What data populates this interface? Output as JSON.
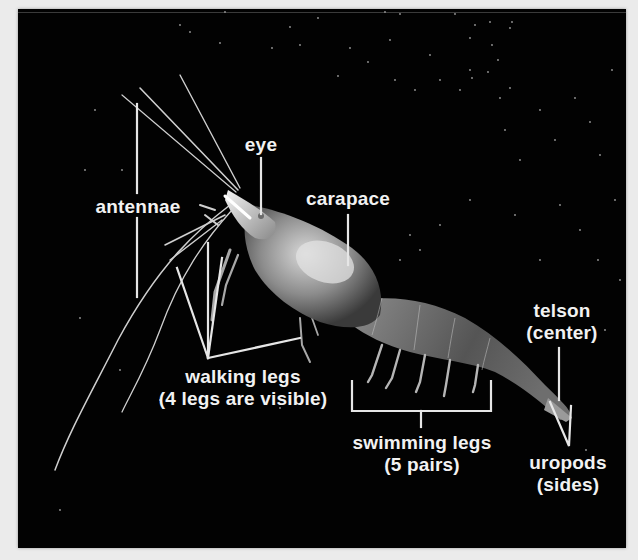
{
  "figure": {
    "background_color": "#020202",
    "label_color": "#f2f2f2"
  },
  "labels": {
    "antennae": "antennae",
    "eye": "eye",
    "carapace": "carapace",
    "walking_legs": {
      "line1": "walking legs",
      "line2": "(4 legs are visible)"
    },
    "swimming_legs": {
      "line1": "swimming legs",
      "line2": "(5 pairs)"
    },
    "telson": {
      "line1": "telson",
      "line2": "(center)"
    },
    "uropods": {
      "line1": "uropods",
      "line2": "(sides)"
    }
  }
}
